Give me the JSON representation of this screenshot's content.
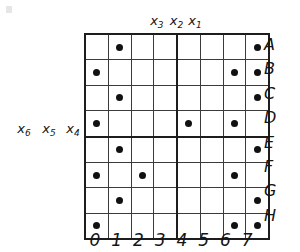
{
  "figure": {
    "colors": {
      "dot": "#111111",
      "grid_line": "#3b3b3b",
      "heavy_line": "#1d1d1d",
      "background": "#ffffff",
      "text": "#151515"
    }
  },
  "top_labels": [
    {
      "base": "x",
      "sub": "3",
      "text": "x3"
    },
    {
      "base": "x",
      "sub": "2",
      "text": "x2"
    },
    {
      "base": "x",
      "sub": "1",
      "text": "x1"
    }
  ],
  "left_labels": [
    {
      "base": "x",
      "sub": "6",
      "text": "x6"
    },
    {
      "base": "x",
      "sub": "5",
      "text": "x5"
    },
    {
      "base": "x",
      "sub": "4",
      "text": "x4"
    }
  ],
  "row_labels": [
    "A",
    "B",
    "C",
    "D",
    "E",
    "F",
    "G",
    "H"
  ],
  "column_labels": [
    "0",
    "1",
    "2",
    "3",
    "4",
    "5",
    "6",
    "7"
  ],
  "chart_data": {
    "type": "heatmap",
    "title": "",
    "xlabel": "",
    "ylabel": "",
    "categories": [
      "0",
      "1",
      "2",
      "3",
      "4",
      "5",
      "6",
      "7"
    ],
    "rows": [
      "A",
      "B",
      "C",
      "D",
      "E",
      "F",
      "G",
      "H"
    ],
    "legend": [],
    "grid": true,
    "heavy_divider_after_column_index": 3,
    "heavy_divider_after_row_index": 3,
    "marker": "filled-dot",
    "values": [
      [
        0,
        1,
        0,
        0,
        0,
        0,
        0,
        1
      ],
      [
        1,
        0,
        0,
        0,
        0,
        0,
        1,
        1
      ],
      [
        0,
        1,
        0,
        0,
        0,
        0,
        0,
        1
      ],
      [
        1,
        0,
        0,
        0,
        1,
        0,
        1,
        0
      ],
      [
        0,
        1,
        0,
        0,
        0,
        0,
        0,
        1
      ],
      [
        1,
        0,
        1,
        0,
        0,
        0,
        1,
        0
      ],
      [
        0,
        1,
        0,
        0,
        0,
        0,
        0,
        1
      ],
      [
        1,
        0,
        0,
        0,
        0,
        0,
        1,
        1
      ]
    ],
    "marked_cells": [
      "A1",
      "A7",
      "B0",
      "B6",
      "B7",
      "C1",
      "C7",
      "D0",
      "D4",
      "D6",
      "E1",
      "E7",
      "F0",
      "F2",
      "F6",
      "G1",
      "G7",
      "H0",
      "H6",
      "H7"
    ]
  }
}
